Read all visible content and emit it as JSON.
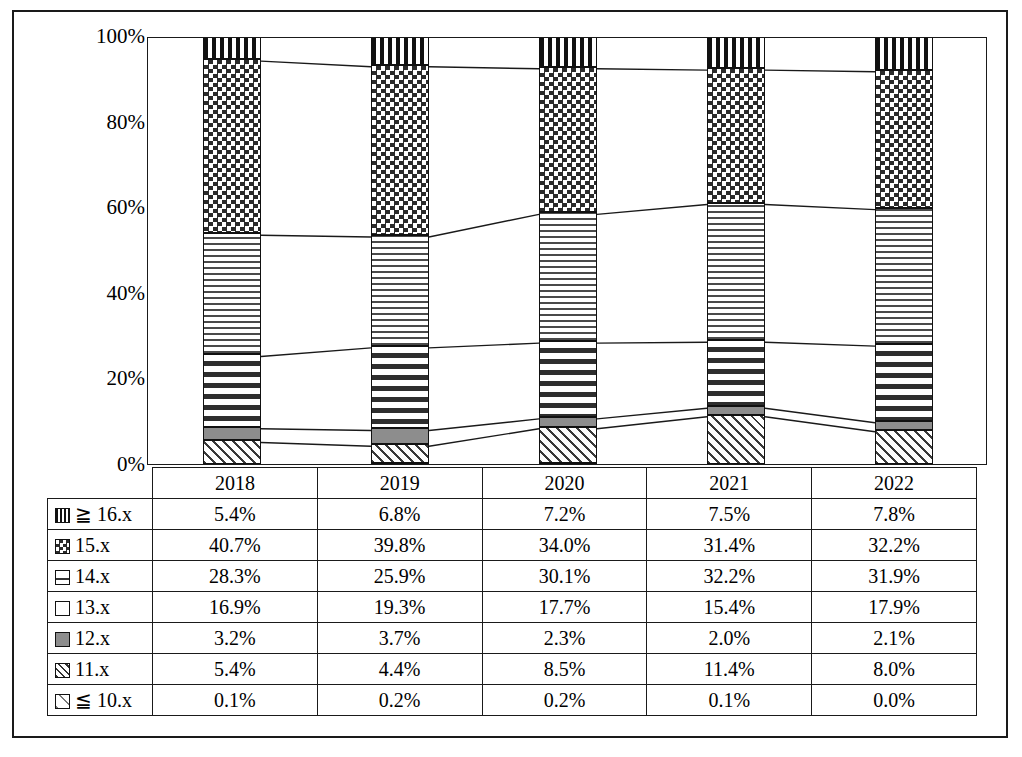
{
  "chart_data": {
    "type": "bar",
    "subtype": "100% stacked column with connector lines",
    "title": "",
    "xlabel": "",
    "ylabel": "",
    "categories": [
      "2018",
      "2019",
      "2020",
      "2021",
      "2022"
    ],
    "ylim": [
      0,
      100
    ],
    "ytick_labels": [
      "0%",
      "20%",
      "40%",
      "60%",
      "80%",
      "100%"
    ],
    "ytick_values": [
      0,
      20,
      40,
      60,
      80,
      100
    ],
    "grid": false,
    "legend_position": "data-table-row-headers",
    "stack_order_top_to_bottom": [
      "≧ 16.x",
      "15.x",
      "14.x",
      "13.x",
      "12.x",
      "11.x",
      "≦ 10.x"
    ],
    "series": [
      {
        "name": "≧ 16.x",
        "pattern": "vertical-stripes",
        "values": [
          5.4,
          6.8,
          7.2,
          7.5,
          7.8
        ],
        "labels": [
          "5.4%",
          "6.8%",
          "7.2%",
          "7.5%",
          "7.8%"
        ]
      },
      {
        "name": "15.x",
        "pattern": "checkerboard",
        "values": [
          40.7,
          39.8,
          34.0,
          31.4,
          32.2
        ],
        "labels": [
          "40.7%",
          "39.8%",
          "34.0%",
          "31.4%",
          "32.2%"
        ]
      },
      {
        "name": "14.x",
        "pattern": "horizontal-stripes",
        "values": [
          28.3,
          25.9,
          30.1,
          32.2,
          31.9
        ],
        "labels": [
          "28.3%",
          "25.9%",
          "30.1%",
          "32.2%",
          "31.9%"
        ]
      },
      {
        "name": "13.x",
        "pattern": "vertical-dashes",
        "values": [
          16.9,
          19.3,
          17.7,
          15.4,
          17.9
        ],
        "labels": [
          "16.9%",
          "19.3%",
          "17.7%",
          "15.4%",
          "17.9%"
        ]
      },
      {
        "name": "12.x",
        "pattern": "solid-gray",
        "values": [
          3.2,
          3.7,
          2.3,
          2.0,
          2.1
        ],
        "labels": [
          "3.2%",
          "3.7%",
          "2.3%",
          "2.0%",
          "2.1%"
        ]
      },
      {
        "name": "11.x",
        "pattern": "diagonal-hatch",
        "values": [
          5.4,
          4.4,
          8.5,
          11.4,
          8.0
        ],
        "labels": [
          "5.4%",
          "4.4%",
          "8.5%",
          "11.4%",
          "8.0%"
        ]
      },
      {
        "name": "≦ 10.x",
        "pattern": "light-diagonal",
        "values": [
          0.1,
          0.2,
          0.2,
          0.1,
          0.0
        ],
        "labels": [
          "0.1%",
          "0.2%",
          "0.2%",
          "0.1%",
          "0.0%"
        ]
      }
    ]
  },
  "table": {
    "corner_label": "",
    "column_headers": [
      "2018",
      "2019",
      "2020",
      "2021",
      "2022"
    ],
    "rows": [
      {
        "label": "≧ 16.x",
        "swatch": "vertical-stripes",
        "cells": [
          "5.4%",
          "6.8%",
          "7.2%",
          "7.5%",
          "7.8%"
        ]
      },
      {
        "label": "15.x",
        "swatch": "checkerboard",
        "cells": [
          "40.7%",
          "39.8%",
          "34.0%",
          "31.4%",
          "32.2%"
        ]
      },
      {
        "label": "14.x",
        "swatch": "horizontal-stripes",
        "cells": [
          "28.3%",
          "25.9%",
          "30.1%",
          "32.2%",
          "31.9%"
        ]
      },
      {
        "label": "13.x",
        "swatch": "vertical-dashes",
        "cells": [
          "16.9%",
          "19.3%",
          "17.7%",
          "15.4%",
          "17.9%"
        ]
      },
      {
        "label": "12.x",
        "swatch": "solid-gray",
        "cells": [
          "3.2%",
          "3.7%",
          "2.3%",
          "2.0%",
          "2.1%"
        ]
      },
      {
        "label": "11.x",
        "swatch": "diagonal-hatch",
        "cells": [
          "5.4%",
          "4.4%",
          "8.5%",
          "11.4%",
          "8.0%"
        ]
      },
      {
        "label": "≦ 10.x",
        "swatch": "light-diagonal",
        "cells": [
          "0.1%",
          "0.2%",
          "0.2%",
          "0.1%",
          "0.0%"
        ]
      }
    ]
  },
  "colors": {
    "line": "#1a1a1a",
    "fill_gray": "#8d8d8d",
    "background": "#ffffff"
  }
}
